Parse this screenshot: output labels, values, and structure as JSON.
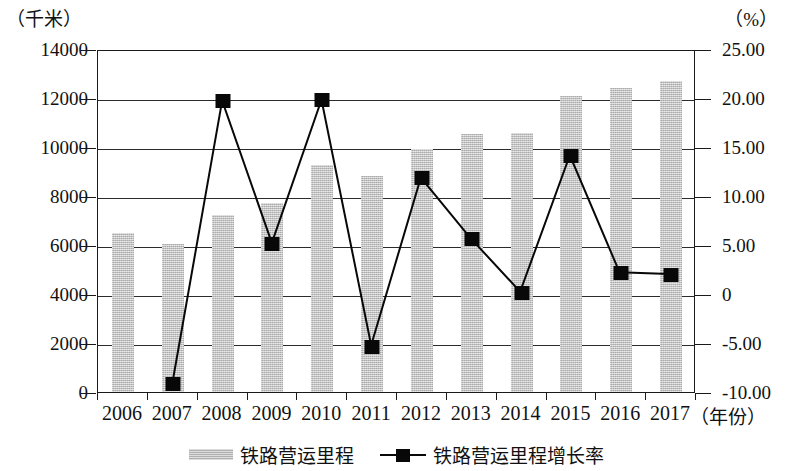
{
  "chart_data": {
    "type": "bar",
    "title": "",
    "xlabel": "（年份）",
    "categories": [
      "2006",
      "2007",
      "2008",
      "2009",
      "2010",
      "2011",
      "2012",
      "2013",
      "2014",
      "2015",
      "2016",
      "2017"
    ],
    "grid": true,
    "legend_position": "bottom",
    "left_axis": {
      "unit": "（千米）",
      "ylabel": "铁路营运里程",
      "ylim": [
        0,
        14000
      ],
      "ticks": [
        "0",
        "2000",
        "4000",
        "6000",
        "8000",
        "10000",
        "12000",
        "14000"
      ],
      "tick_values": [
        0,
        2000,
        4000,
        6000,
        8000,
        10000,
        12000,
        14000
      ]
    },
    "right_axis": {
      "unit": "（%）",
      "ylabel": "铁路营运里程增长率",
      "ylim": [
        -10,
        25
      ],
      "ticks": [
        "-10.00",
        "-5.00",
        "0",
        "5.00",
        "10.00",
        "15.00",
        "20.00",
        "25.00"
      ],
      "tick_values": [
        -10,
        -5,
        0,
        5,
        10,
        15,
        20,
        25
      ]
    },
    "series": [
      {
        "name": "铁路营运里程",
        "type": "bar",
        "axis": "left",
        "values": [
          6480,
          6030,
          7230,
          7700,
          9250,
          8820,
          9930,
          10540,
          10570,
          12100,
          12400,
          12680
        ]
      },
      {
        "name": "铁路营运里程增长率",
        "type": "line",
        "axis": "right",
        "values": [
          null,
          -9.0,
          19.9,
          5.3,
          20.0,
          -5.2,
          12.0,
          5.8,
          0.3,
          14.3,
          2.3,
          2.1
        ]
      }
    ]
  },
  "legend": {
    "items": [
      {
        "label": "铁路营运里程",
        "marker": "bar-swatch"
      },
      {
        "label": "铁路营运里程增长率",
        "marker": "line-square-marker"
      }
    ]
  }
}
